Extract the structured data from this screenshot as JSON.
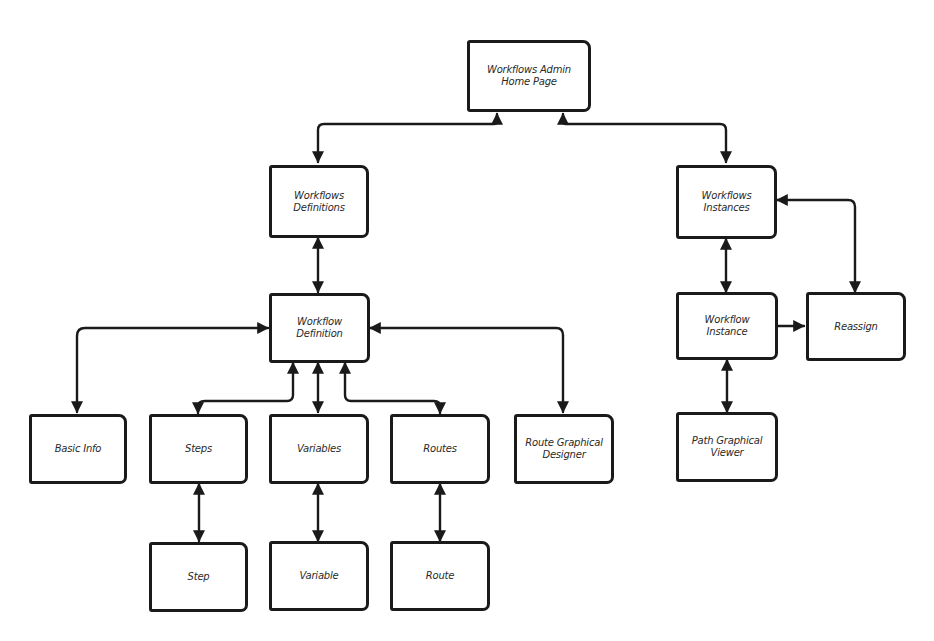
{
  "diagram": {
    "type": "sitemap-flow",
    "nodes": {
      "home": {
        "label": "Workflows Admin Home Page"
      },
      "definitions": {
        "label": "Workflows Definitions"
      },
      "instances": {
        "label": "Workflows Instances"
      },
      "definition": {
        "label": "Workflow Definition"
      },
      "instance": {
        "label": "Workflow Instance"
      },
      "reassign": {
        "label": "Reassign"
      },
      "basic_info": {
        "label": "Basic Info"
      },
      "steps": {
        "label": "Steps"
      },
      "variables": {
        "label": "Variables"
      },
      "routes": {
        "label": "Routes"
      },
      "route_designer": {
        "label": "Route Graphical Designer"
      },
      "path_viewer": {
        "label": "Path Graphical Viewer"
      },
      "step": {
        "label": "Step"
      },
      "variable": {
        "label": "Variable"
      },
      "route": {
        "label": "Route"
      }
    },
    "edges": [
      {
        "from": "home",
        "to": "definitions",
        "direction": "both"
      },
      {
        "from": "home",
        "to": "instances",
        "direction": "both"
      },
      {
        "from": "definitions",
        "to": "definition",
        "direction": "both"
      },
      {
        "from": "instances",
        "to": "instance",
        "direction": "both"
      },
      {
        "from": "instances",
        "to": "reassign",
        "direction": "both"
      },
      {
        "from": "instance",
        "to": "reassign",
        "direction": "forward"
      },
      {
        "from": "instance",
        "to": "path_viewer",
        "direction": "both"
      },
      {
        "from": "definition",
        "to": "basic_info",
        "direction": "both"
      },
      {
        "from": "definition",
        "to": "steps",
        "direction": "both"
      },
      {
        "from": "definition",
        "to": "variables",
        "direction": "both"
      },
      {
        "from": "definition",
        "to": "routes",
        "direction": "both"
      },
      {
        "from": "definition",
        "to": "route_designer",
        "direction": "both"
      },
      {
        "from": "steps",
        "to": "step",
        "direction": "both"
      },
      {
        "from": "variables",
        "to": "variable",
        "direction": "both"
      },
      {
        "from": "routes",
        "to": "route",
        "direction": "both"
      }
    ]
  }
}
